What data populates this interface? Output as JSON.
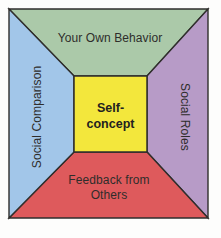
{
  "diagram": {
    "name": "self-concept-sources-diagram",
    "stroke_color": "#2f2e2c",
    "background_color": "#fdfdfc",
    "center": {
      "label": "Self-concept",
      "lines": [
        "Self-",
        "concept"
      ],
      "color": "#f3e73c"
    },
    "top": {
      "label": "Your Own Behavior",
      "color": "#abc9a9"
    },
    "left": {
      "label": "Social Comparison",
      "color": "#a2c6e9"
    },
    "right": {
      "label": "Social Roles",
      "color": "#b79bc7"
    },
    "bottom": {
      "label": "Feedback from Others",
      "lines": [
        "Feedback from",
        "Others"
      ],
      "color": "#de5a5c"
    }
  }
}
